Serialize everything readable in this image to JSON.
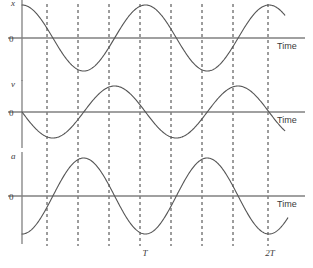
{
  "figure": {
    "background": "#ffffff",
    "curve_color": "#555555",
    "axis_color": "#808080",
    "dash_color": "#3a3a3a",
    "width": 313,
    "height": 268
  },
  "panels": [
    {
      "id": "displacement",
      "y_axis_label": "x",
      "zero_label": "0",
      "time_label": "Time",
      "phase": "cosine",
      "baseline_y": 38,
      "amplitude_px": 33,
      "axis_x": 22,
      "curve_start_x": 22,
      "curve_end_x": 285
    },
    {
      "id": "velocity",
      "y_axis_label": "v",
      "zero_label": "0",
      "time_label": "Time",
      "phase": "negative-sine",
      "baseline_y": 112,
      "amplitude_px": 26,
      "axis_x": 22,
      "curve_start_x": 22,
      "curve_end_x": 285
    },
    {
      "id": "acceleration",
      "y_axis_label": "a",
      "zero_label": "0",
      "time_label": "Time",
      "phase": "negative-cosine",
      "baseline_y": 196,
      "amplitude_px": 38,
      "axis_x": 22,
      "curve_start_x": 22,
      "curve_end_x": 288
    }
  ],
  "gridlines": {
    "x_positions": [
      47,
      78,
      109,
      140,
      171,
      202,
      233,
      268
    ],
    "top": 4,
    "bottom": 246,
    "style": "dashed"
  },
  "period_ticks": [
    {
      "label": "T",
      "x": 145,
      "y": 256
    },
    {
      "label": "2T",
      "x": 270,
      "y": 256
    }
  ],
  "chart_data": {
    "type": "line",
    "xlabel": "Time",
    "ylabel": "",
    "grid": true,
    "legend": "none",
    "x": [
      0,
      0.125,
      0.25,
      0.375,
      0.5,
      0.625,
      0.75,
      0.875,
      1,
      1.125,
      1.25,
      1.375,
      1.5,
      1.625,
      1.75,
      1.875,
      2
    ],
    "x_unit": "periods (T)",
    "xlim": [
      0,
      2.1
    ],
    "ylim": [
      -1,
      1
    ],
    "xtick_labels": [
      "T",
      "2T"
    ],
    "xtick_values": [
      1,
      2
    ],
    "series": [
      {
        "name": "x",
        "label": "displacement",
        "equation": "x = A cos(2πt/T)",
        "values": [
          1,
          0.707,
          0,
          -0.707,
          -1,
          -0.707,
          0,
          0.707,
          1,
          0.707,
          0,
          -0.707,
          -1,
          -0.707,
          0,
          0.707,
          1
        ]
      },
      {
        "name": "v",
        "label": "velocity",
        "equation": "v = -Aω sin(2πt/T)",
        "values": [
          0,
          -0.707,
          -1,
          -0.707,
          0,
          0.707,
          1,
          0.707,
          0,
          -0.707,
          -1,
          -0.707,
          0,
          0.707,
          1,
          0.707,
          0
        ]
      },
      {
        "name": "a",
        "label": "acceleration",
        "equation": "a = -Aω² cos(2πt/T)",
        "values": [
          -1,
          -0.707,
          0,
          0.707,
          1,
          0.707,
          0,
          -0.707,
          -1,
          -0.707,
          0,
          0.707,
          1,
          0.707,
          0,
          -0.707,
          -1
        ]
      }
    ]
  }
}
